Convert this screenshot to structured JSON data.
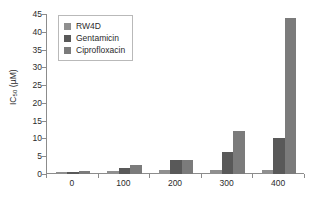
{
  "chart_data": {
    "type": "bar",
    "title": "",
    "subtitle": "",
    "xlabel": "",
    "ylabel": "IC50 (µM)",
    "ylabel_base": "IC",
    "ylabel_sub": "50",
    "ylabel_unit": " (µM)",
    "categories": [
      "0",
      "100",
      "200",
      "300",
      "400"
    ],
    "series": [
      {
        "name": "RW4D",
        "color": "#8f8f8f",
        "values": [
          0.7,
          0.9,
          1.0,
          1.0,
          1.1
        ]
      },
      {
        "name": "Gentamicin",
        "color": "#595959",
        "values": [
          0.7,
          1.8,
          4.0,
          6.1,
          10.2
        ]
      },
      {
        "name": "Ciprofloxacin",
        "color": "#7b7b7b",
        "values": [
          0.8,
          2.5,
          4.0,
          12.1,
          44.0
        ]
      }
    ],
    "ylim": [
      0,
      45
    ],
    "yticks": [
      0,
      5,
      10,
      15,
      20,
      25,
      30,
      35,
      40,
      45
    ],
    "ytick_labels": [
      "0",
      "5",
      "10",
      "15",
      "20",
      "25",
      "30",
      "35",
      "40",
      "45"
    ],
    "grid": false,
    "legend_position": "upper left",
    "axis_color": "#8c8c8c",
    "background": "#ffffff"
  },
  "legend": {
    "items": [
      {
        "label": "RW4D"
      },
      {
        "label": "Gentamicin"
      },
      {
        "label": "Ciprofloxacin"
      }
    ]
  }
}
